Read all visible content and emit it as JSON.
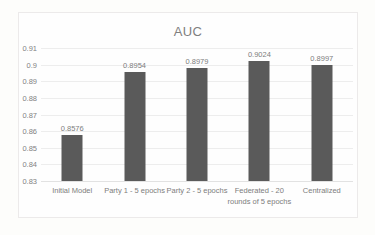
{
  "chart_data": {
    "type": "bar",
    "title": "AUC",
    "xlabel": "",
    "ylabel": "",
    "ylim": [
      0.83,
      0.91
    ],
    "ytick_step": 0.01,
    "yticks": [
      "0.91",
      "0.9",
      "0.89",
      "0.88",
      "0.87",
      "0.86",
      "0.85",
      "0.84",
      "0.83"
    ],
    "grid": true,
    "legend": "none",
    "bar_color": "#5a5a5a",
    "categories": [
      "Initial Model",
      "Party 1 - 5 epochs",
      "Party 2 - 5 epochs",
      "Federated - 20 rounds of 5 epochs",
      "Centralized"
    ],
    "values": [
      0.8576,
      0.8954,
      0.8979,
      0.9024,
      0.8997
    ],
    "data_labels": [
      "0.8576",
      "0.8954",
      "0.8979",
      "0.9024",
      "0.8997"
    ]
  }
}
